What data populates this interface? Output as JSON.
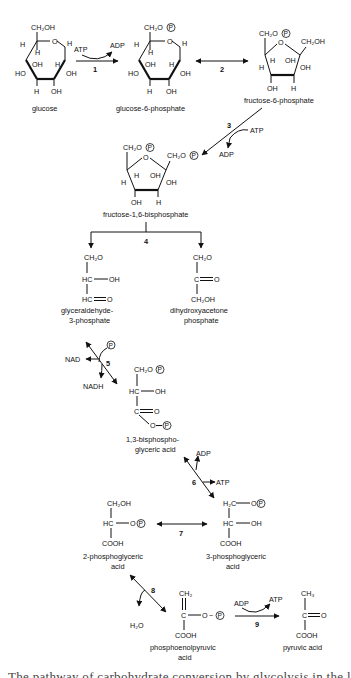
{
  "diagram": {
    "compounds": {
      "glucose": "glucose",
      "g6p": "glucose-6-phosphate",
      "f6p": "fructose-6-phosphate",
      "f16bp": "fructose-1,6-bisphosphate",
      "gap_1": "glyceraldehyde-",
      "gap_2": "3-phosphate",
      "dhap_1": "dihydroxyacetone",
      "dhap_2": "phosphate",
      "bpg_1": "1,3-bisphospho-",
      "bpg_2": "glyceric acid",
      "pg3_1": "3-phosphoglyceric",
      "pg3_2": "acid",
      "pg2_1": "2-phosphoglyceric",
      "pg2_2": "acid",
      "pep_1": "phosphoenolpyruvic",
      "pep_2": "acid",
      "pyruvate": "pyruvic acid"
    },
    "steps": {
      "s1": "1",
      "s2": "2",
      "s3": "3",
      "s4": "4",
      "s5": "5",
      "s6": "6",
      "s7": "7",
      "s8": "8",
      "s9": "9"
    },
    "cofactors": {
      "s1_in": "ATP",
      "s1_out": "ADP",
      "s3_in": "ATP",
      "s3_out": "ADP",
      "s5_in": "NAD",
      "s5_out": "NADH",
      "s5_p": "P",
      "s6_out": "ADP",
      "s6_in": "ATP",
      "s8_out": "H₂O",
      "s9_in": "ADP",
      "s9_out": "ATP"
    },
    "atoms": {
      "ch2oh": "CH₂OH",
      "ch2o": "CH₂O",
      "h2c": "H₂C",
      "ch2": "CH₂",
      "ch3": "CH₃",
      "o": "O",
      "h": "H",
      "oh": "OH",
      "ho": "HO",
      "hc": "HC",
      "c": "C",
      "cooh": "COOH",
      "p": "P",
      "dash_o": "O",
      "tilde": "~"
    },
    "caption_partial": "The pathway of carbohydrate conversion by glycolysis in the liver. T"
  }
}
